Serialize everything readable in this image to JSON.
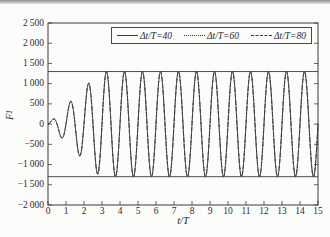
{
  "page": {
    "background": "#fcfcfb",
    "top_band": "scanned-page-edge"
  },
  "chart_data": {
    "type": "line",
    "title": "",
    "xlabel": "t/T",
    "ylabel_main": "F",
    "ylabel_sub": "1",
    "xlim": [
      0,
      15
    ],
    "ylim": [
      -2000,
      2500
    ],
    "grid": false,
    "line_color": "#3b3b3b",
    "x_ticks": [
      0,
      1,
      2,
      3,
      4,
      5,
      6,
      7,
      8,
      9,
      10,
      11,
      12,
      13,
      14,
      15
    ],
    "x_tick_labels": [
      "0",
      "1",
      "2",
      "3",
      "4",
      "5",
      "6",
      "7",
      "8",
      "9",
      "10",
      "11",
      "12",
      "13",
      "14",
      "15"
    ],
    "y_ticks": [
      2500,
      2000,
      1500,
      1000,
      500,
      0,
      -500,
      -1000,
      -1500,
      -2000
    ],
    "y_tick_labels": [
      "2 500",
      "2 000",
      "1 500",
      "1 000",
      "500",
      "0",
      "−500",
      "−1 000",
      "−1 500",
      "−2 000"
    ],
    "legend": {
      "position": "top",
      "entries": [
        {
          "label": "Δt/T=40",
          "style": "solid"
        },
        {
          "label": "Δt/T=60",
          "style": "dotted"
        },
        {
          "label": "Δt/T=80",
          "style": "dashed"
        }
      ]
    },
    "series": [
      {
        "name": "Δt/T=40",
        "style": "solid"
      },
      {
        "name": "Δt/T=60",
        "style": "dotted"
      },
      {
        "name": "Δt/T=80",
        "style": "dashed"
      }
    ],
    "series_note": "all three time-step curves coincide visually",
    "signal": {
      "description": "F = A(t)*sin(2*pi*t/period); amplitude ramps linearly from 0 to 1300 over 0<=t<=ramp_end, constant 1300 after",
      "amplitude": 1300,
      "period": 1.0,
      "phase": 0,
      "ramp": "linear",
      "ramp_end": 2.9,
      "t_range": [
        0,
        15
      ],
      "sample_step": 0.01,
      "key_points": [
        {
          "t": 0.0,
          "F": 0
        },
        {
          "t": 0.3,
          "F": 130
        },
        {
          "t": 0.85,
          "F": -270
        },
        {
          "t": 1.3,
          "F": 580
        },
        {
          "t": 1.85,
          "F": -830
        },
        {
          "t": 2.35,
          "F": 1100
        },
        {
          "t": 3.2,
          "F": 1300
        },
        {
          "t": 14.2,
          "F": 1300
        }
      ],
      "steady_amplitude": 1300
    },
    "envelope_lines": [
      1300,
      -1300
    ]
  }
}
